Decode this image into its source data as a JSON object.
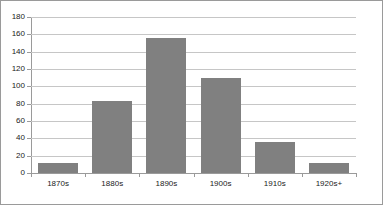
{
  "chart_data": {
    "type": "bar",
    "title": "",
    "subtitle": "",
    "xlabel": "",
    "ylabel": "",
    "categories": [
      "1870s",
      "1880s",
      "1890s",
      "1900s",
      "1910s",
      "1920s+"
    ],
    "values": [
      11,
      83,
      156,
      110,
      36,
      11
    ],
    "series": [
      {
        "name": "",
        "values": [
          11,
          83,
          156,
          110,
          36,
          11
        ]
      }
    ],
    "ylim": [
      0,
      180
    ],
    "ytick_step": 20,
    "yticks": [
      0,
      20,
      40,
      60,
      80,
      100,
      120,
      140,
      160,
      180
    ],
    "ytick_labels": [
      "0",
      "20",
      "40",
      "60",
      "80",
      "100",
      "120",
      "140",
      "160",
      "180"
    ],
    "grid": true,
    "grid_axis": "y",
    "legend": false,
    "legend_position": "none",
    "annotations": [],
    "colors": {
      "bar_fill": "#808080",
      "gridline": "#c6c6c6",
      "axis_line": "#9a9a9a",
      "frame_border": "#9a9a9a",
      "text": "#1a1a1a",
      "plot_background": "#ffffff"
    }
  }
}
